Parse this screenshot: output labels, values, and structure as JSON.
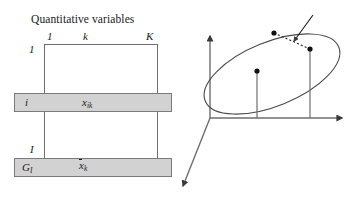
{
  "figure": {
    "panels": [
      "quantitative-variables-table",
      "cloud-of-individuals-in-RK"
    ]
  },
  "left_panel": {
    "title": "Quantitative variables",
    "column_headers": {
      "first": "1",
      "generic": "k",
      "last": "K"
    },
    "row_headers": {
      "first": "1",
      "last": "I"
    },
    "highlighted_row": {
      "label": "i",
      "value_base": "x",
      "value_sub": "ik"
    },
    "mean_row": {
      "label_base": "G",
      "label_sub": "I",
      "value_base": "x",
      "value_sub": "k",
      "value_overline": true
    },
    "colors": {
      "band_fill": "#d2d2d2",
      "rule": "#6e6e6e"
    }
  },
  "right_panel": {
    "space_label_base": "R",
    "space_label_sup": "K",
    "origin": "O",
    "axis_label": "k",
    "cloud_label_base": "N",
    "cloud_label_sub": "I",
    "points": [
      {
        "name": "M-l",
        "base": "M",
        "sub": "l"
      },
      {
        "name": "M-i",
        "base": "M",
        "sub": "i"
      },
      {
        "name": "G-I",
        "base": "G",
        "sub": "I"
      }
    ],
    "distance_annotation": {
      "base": "d",
      "sup": "2",
      "args": "(i, l)"
    },
    "axis_ticks": [
      {
        "name": "mean-tick",
        "base": "x",
        "sub": "k",
        "overline": true
      },
      {
        "name": "individual-tick",
        "base": "x",
        "sub": "ik",
        "overline": false
      }
    ]
  }
}
